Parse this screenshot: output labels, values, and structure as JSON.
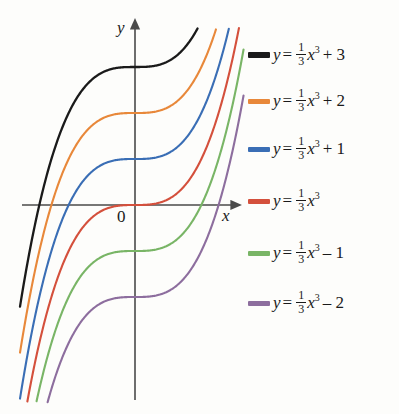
{
  "figure": {
    "kind": "math-graph",
    "axes": {
      "x_label": "x",
      "y_label": "y",
      "origin_label": "0"
    }
  },
  "chart_data": {
    "type": "line",
    "title": "",
    "xlabel": "x",
    "ylabel": "y",
    "grid": false,
    "legend_position": "right",
    "origin_label": "0",
    "xlim": [
      -2.45,
      2.25
    ],
    "ylim": [
      -4.0,
      4.0
    ],
    "x_axis_arrow": true,
    "y_axis_arrow": true,
    "function_form": "y = (1/3)x^3 + c",
    "series": [
      {
        "name": "y = 1/3 x^3 + 3",
        "color": "#1a1a1a",
        "c": 3,
        "y_intercept": 3,
        "legend_text": {
          "lhs": "y",
          "eq": "=",
          "num": "1",
          "den": "3",
          "x": "x",
          "power": "3",
          "tail": "+ 3"
        }
      },
      {
        "name": "y = 1/3 x^3 + 2",
        "color": "#e8883a",
        "c": 2,
        "y_intercept": 2,
        "legend_text": {
          "lhs": "y",
          "eq": "=",
          "num": "1",
          "den": "3",
          "x": "x",
          "power": "3",
          "tail": "+ 2"
        }
      },
      {
        "name": "y = 1/3 x^3 + 1",
        "color": "#3a6eb5",
        "c": 1,
        "y_intercept": 1,
        "legend_text": {
          "lhs": "y",
          "eq": "=",
          "num": "1",
          "den": "3",
          "x": "x",
          "power": "3",
          "tail": "+ 1"
        }
      },
      {
        "name": "y = 1/3 x^3",
        "color": "#d4503c",
        "c": 0,
        "y_intercept": 0,
        "legend_text": {
          "lhs": "y",
          "eq": "=",
          "num": "1",
          "den": "3",
          "x": "x",
          "power": "3",
          "tail": ""
        }
      },
      {
        "name": "y = 1/3 x^3 - 1",
        "color": "#79b566",
        "c": -1,
        "y_intercept": -1,
        "legend_text": {
          "lhs": "y",
          "eq": "=",
          "num": "1",
          "den": "3",
          "x": "x",
          "power": "3",
          "tail": "– 1"
        }
      },
      {
        "name": "y = 1/3 x^3 - 2",
        "color": "#8d6e9e",
        "c": -2,
        "y_intercept": -2,
        "legend_text": {
          "lhs": "y",
          "eq": "=",
          "num": "1",
          "den": "3",
          "x": "x",
          "power": "3",
          "tail": "– 2"
        }
      }
    ]
  }
}
